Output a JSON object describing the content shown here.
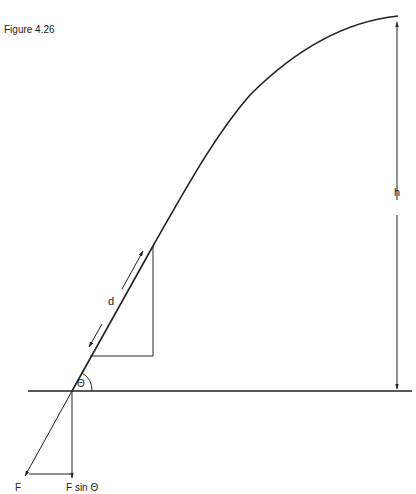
{
  "figure": {
    "title": "Figure 4.26",
    "labels": {
      "d": "d",
      "h": "h",
      "theta": "Θ",
      "force": "F",
      "force_component": "F sin Θ"
    },
    "colors": {
      "stroke": "#222222",
      "background": "#ffffff"
    }
  }
}
